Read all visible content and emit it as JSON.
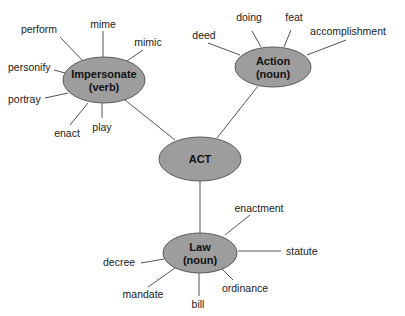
{
  "diagram": {
    "colors": {
      "node_fill": "#9d9d9d",
      "node_stroke": "#5a5a5a",
      "edge": "#555555",
      "text": "#111111"
    },
    "nodes": [
      {
        "id": "act",
        "lines": [
          "ACT"
        ],
        "cx": 200,
        "cy": 159,
        "rx": 41,
        "ry": 22
      },
      {
        "id": "impersonate",
        "lines": [
          "Impersonate",
          "(verb)"
        ],
        "cx": 104,
        "cy": 80,
        "rx": 41,
        "ry": 23
      },
      {
        "id": "action",
        "lines": [
          "Action",
          "(noun)"
        ],
        "cx": 273,
        "cy": 67,
        "rx": 38,
        "ry": 20
      },
      {
        "id": "law",
        "lines": [
          "Law",
          "(noun)"
        ],
        "cx": 200,
        "cy": 253,
        "rx": 37,
        "ry": 20
      }
    ],
    "node_edges": [
      {
        "from": "impersonate",
        "to": "act",
        "x1": 125,
        "y1": 100,
        "x2": 175,
        "y2": 140
      },
      {
        "from": "action",
        "to": "act",
        "x1": 258,
        "y1": 86,
        "x2": 217,
        "y2": 138
      },
      {
        "from": "act",
        "to": "law",
        "x1": 200,
        "y1": 181,
        "x2": 200,
        "y2": 233
      }
    ],
    "leaves": [
      {
        "parent": "impersonate",
        "label": "perform",
        "tx": 39,
        "ty": 33,
        "anchor": "middle",
        "x1": 60,
        "y1": 37,
        "x2": 82,
        "y2": 60
      },
      {
        "parent": "impersonate",
        "label": "mime",
        "tx": 103,
        "ty": 28,
        "anchor": "middle",
        "x1": 103,
        "y1": 31,
        "x2": 103,
        "y2": 57
      },
      {
        "parent": "impersonate",
        "label": "mimic",
        "tx": 148,
        "ty": 46,
        "anchor": "middle",
        "x1": 143,
        "y1": 50,
        "x2": 127,
        "y2": 61
      },
      {
        "parent": "impersonate",
        "label": "personify",
        "tx": 8,
        "ty": 71,
        "anchor": "start",
        "x1": 54,
        "y1": 70,
        "x2": 65,
        "y2": 73
      },
      {
        "parent": "impersonate",
        "label": "portray",
        "tx": 8,
        "ty": 103,
        "anchor": "start",
        "x1": 45,
        "y1": 98,
        "x2": 68,
        "y2": 93
      },
      {
        "parent": "impersonate",
        "label": "enact",
        "tx": 67,
        "ty": 137,
        "anchor": "middle",
        "x1": 70,
        "y1": 125,
        "x2": 88,
        "y2": 103
      },
      {
        "parent": "impersonate",
        "label": "play",
        "tx": 102,
        "ty": 131,
        "anchor": "middle",
        "x1": 102,
        "y1": 103,
        "x2": 102,
        "y2": 118
      },
      {
        "parent": "action",
        "label": "deed",
        "tx": 204,
        "ty": 39,
        "anchor": "middle",
        "x1": 208,
        "y1": 43,
        "x2": 240,
        "y2": 55
      },
      {
        "parent": "action",
        "label": "doing",
        "tx": 249,
        "ty": 21,
        "anchor": "middle",
        "x1": 252,
        "y1": 31,
        "x2": 261,
        "y2": 47
      },
      {
        "parent": "action",
        "label": "feat",
        "tx": 294,
        "ty": 21,
        "anchor": "middle",
        "x1": 291,
        "y1": 30,
        "x2": 284,
        "y2": 47
      },
      {
        "parent": "action",
        "label": "accomplishment",
        "tx": 348,
        "ty": 35,
        "anchor": "middle",
        "x1": 346,
        "y1": 40,
        "x2": 307,
        "y2": 55
      },
      {
        "parent": "law",
        "label": "enactment",
        "tx": 259,
        "ty": 212,
        "anchor": "middle",
        "x1": 250,
        "y1": 215,
        "x2": 225,
        "y2": 235
      },
      {
        "parent": "law",
        "label": "statute",
        "tx": 286,
        "ty": 255,
        "anchor": "start",
        "x1": 238,
        "y1": 251,
        "x2": 281,
        "y2": 251
      },
      {
        "parent": "law",
        "label": "decree",
        "tx": 103,
        "ty": 266,
        "anchor": "start",
        "x1": 141,
        "y1": 263,
        "x2": 164,
        "y2": 259
      },
      {
        "parent": "law",
        "label": "mandate",
        "tx": 143,
        "ty": 298,
        "anchor": "middle",
        "x1": 148,
        "y1": 287,
        "x2": 175,
        "y2": 268
      },
      {
        "parent": "law",
        "label": "bill",
        "tx": 198,
        "ty": 308,
        "anchor": "middle",
        "x1": 199,
        "y1": 272,
        "x2": 199,
        "y2": 296
      },
      {
        "parent": "law",
        "label": "ordinance",
        "tx": 245,
        "ty": 292,
        "anchor": "middle",
        "x1": 221,
        "y1": 268,
        "x2": 233,
        "y2": 280
      }
    ]
  }
}
